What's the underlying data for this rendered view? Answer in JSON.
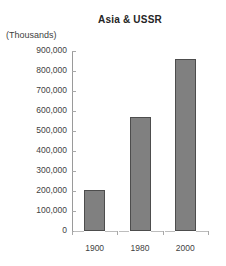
{
  "chart_data": {
    "type": "bar",
    "title": "Asia & USSR",
    "units_label": "(Thousands)",
    "categories": [
      "1900",
      "1980",
      "2000"
    ],
    "values": [
      205000,
      570000,
      860000
    ],
    "xlabel": "",
    "ylabel": "",
    "ylim": [
      0,
      900000
    ],
    "y_ticks": [
      "900,000",
      "800,000",
      "700,000",
      "600,000",
      "500,000",
      "400,000",
      "300,000",
      "200,000",
      "100,000",
      "0"
    ],
    "y_tick_values": [
      900000,
      800000,
      700000,
      600000,
      500000,
      400000,
      300000,
      200000,
      100000,
      0
    ],
    "grid": false,
    "legend": null,
    "colors": {
      "bar_fill": "#808080",
      "bar_border": "#4d4d4d",
      "axis": "#9a9a9a",
      "text": "#3f3f3f",
      "title": "#252525",
      "background": "#ffffff"
    }
  }
}
